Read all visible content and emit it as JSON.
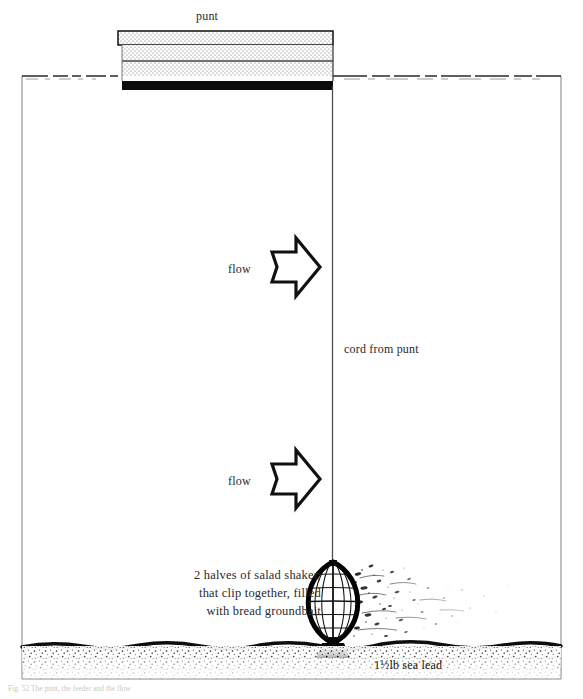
{
  "figure": {
    "caption": "Fig. 52   The punt, the feeder and the flow"
  },
  "labels": {
    "punt": "punt",
    "cord": "cord from punt",
    "flow_upper": "flow",
    "flow_lower": "flow",
    "shaker": "2 halves of salad shaker, that clip together, filled with bread groundbait",
    "lead": "1½lb sea lead"
  },
  "colors": {
    "ink": "#000000",
    "text": "#2a2a2a",
    "water_line": "#2b2b2b",
    "hull_dark": "#0a0a0a",
    "stipple": "#6d6d6d",
    "frame": "#8a8a8a",
    "bed_line": "#0d0d0d",
    "gravel": "#1a1a1a",
    "plume": "#2a2a2a",
    "paper": "#ffffff"
  },
  "geometry": {
    "width": 583,
    "height": 699,
    "water_surface_y": 76,
    "bed_line_y": 645,
    "frame_left_x": 22,
    "frame_right_x": 561,
    "cord_x": 332,
    "punt": {
      "left": 118,
      "right": 333,
      "gunwale_top_y": 31,
      "gunwale_bottom_y": 45,
      "hull_bottom_y": 86,
      "waterline_y": 76,
      "thwart_y": 61
    },
    "feeder": {
      "center_x": 333,
      "top_y": 562,
      "bottom_y": 643,
      "half_width": 26
    },
    "arrows": [
      {
        "x": 272,
        "y": 238,
        "w": 48,
        "h": 58
      },
      {
        "x": 272,
        "y": 450,
        "w": 48,
        "h": 58
      }
    ]
  },
  "elements": {
    "punt_name": "punt-hull",
    "cord_name": "cord-line",
    "feeder_name": "salad-shaker-feeder",
    "lead_name": "sea-lead-weight",
    "plume_name": "groundbait-plume",
    "bed_name": "river-bed",
    "water_name": "water-surface"
  }
}
